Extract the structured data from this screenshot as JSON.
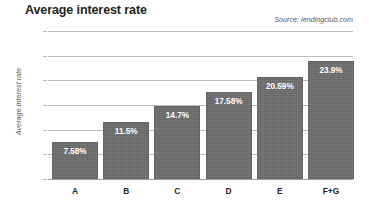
{
  "header": {
    "title": "Average interest rate",
    "source": "Source: lendingclub.com"
  },
  "chart_data": {
    "type": "bar",
    "title": "Average interest rate",
    "subtitle": "",
    "source": "Source: lendingclub.com",
    "xlabel": "",
    "ylabel": "Average interest rate",
    "categories": [
      "A",
      "B",
      "C",
      "D",
      "E",
      "F+G"
    ],
    "values": [
      7.58,
      11.5,
      14.7,
      17.58,
      20.59,
      23.9
    ],
    "value_labels": [
      "7.58%",
      "11.5%",
      "14.7%",
      "17.58%",
      "20.59%",
      "23.9%"
    ],
    "ylim": [
      0,
      30
    ],
    "ytick_values": [
      0,
      5,
      10,
      15,
      20,
      25,
      30
    ],
    "ytick_labels": [
      "0%",
      "5%",
      "10%",
      "15%",
      "20%",
      "25%",
      "30%"
    ],
    "grid": true,
    "legend": "none",
    "series_color": "#6e6e6e",
    "gridline_color": "#b9bcbe",
    "label_color": "#ffffff"
  }
}
